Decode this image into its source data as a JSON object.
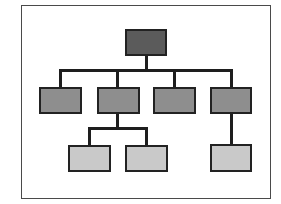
{
  "diagram": {
    "type": "org-chart-hierarchy",
    "frame": {
      "x": 21,
      "y": 5,
      "w": 250,
      "h": 194,
      "border": "#4a4a4a"
    },
    "line_color": "#1e1e1e",
    "line_width": 3,
    "levels": {
      "root": {
        "fill": "#5b5b5b"
      },
      "middle": {
        "fill": "#8e8e8e"
      },
      "leaf": {
        "fill": "#c9c9c9"
      }
    },
    "nodes": [
      {
        "id": "root",
        "level": "root",
        "label": "",
        "x": 125,
        "y": 29,
        "w": 42,
        "h": 27
      },
      {
        "id": "mid-1",
        "level": "middle",
        "label": "",
        "x": 39,
        "y": 87,
        "w": 43,
        "h": 27
      },
      {
        "id": "mid-2",
        "level": "middle",
        "label": "",
        "x": 97,
        "y": 87,
        "w": 43,
        "h": 27
      },
      {
        "id": "mid-3",
        "level": "middle",
        "label": "",
        "x": 153,
        "y": 87,
        "w": 43,
        "h": 27
      },
      {
        "id": "mid-4",
        "level": "middle",
        "label": "",
        "x": 210,
        "y": 87,
        "w": 42,
        "h": 27
      },
      {
        "id": "leaf-1",
        "level": "leaf",
        "label": "",
        "x": 68,
        "y": 145,
        "w": 43,
        "h": 27
      },
      {
        "id": "leaf-2",
        "level": "leaf",
        "label": "",
        "x": 125,
        "y": 145,
        "w": 43,
        "h": 27
      },
      {
        "id": "leaf-3",
        "level": "leaf",
        "label": "",
        "x": 210,
        "y": 144,
        "w": 42,
        "h": 28
      }
    ],
    "edges": [
      {
        "from": "root",
        "to": "mid-1"
      },
      {
        "from": "root",
        "to": "mid-2"
      },
      {
        "from": "root",
        "to": "mid-3"
      },
      {
        "from": "root",
        "to": "mid-4"
      },
      {
        "from": "mid-2",
        "to": "leaf-1"
      },
      {
        "from": "mid-2",
        "to": "leaf-2"
      },
      {
        "from": "mid-4",
        "to": "leaf-3"
      }
    ]
  }
}
